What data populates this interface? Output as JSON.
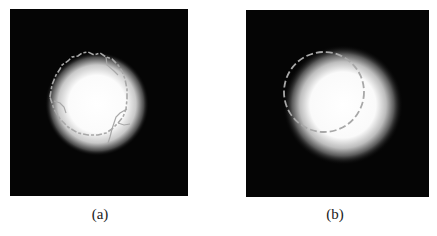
{
  "figure": {
    "panels": [
      {
        "id": "a",
        "caption": "(a)",
        "description": "Bright blurred disk with irregular grey contour (dashed circle with jagged edges)",
        "background_color": "#050505",
        "blob_color": "#ffffff",
        "contour_color": "#a8a8a8"
      },
      {
        "id": "b",
        "caption": "(b)",
        "description": "Bright blurred disk with smooth dashed grey circle contour offset up-left",
        "background_color": "#050505",
        "blob_color": "#ffffff",
        "contour_color": "#a8a8a8"
      }
    ]
  }
}
